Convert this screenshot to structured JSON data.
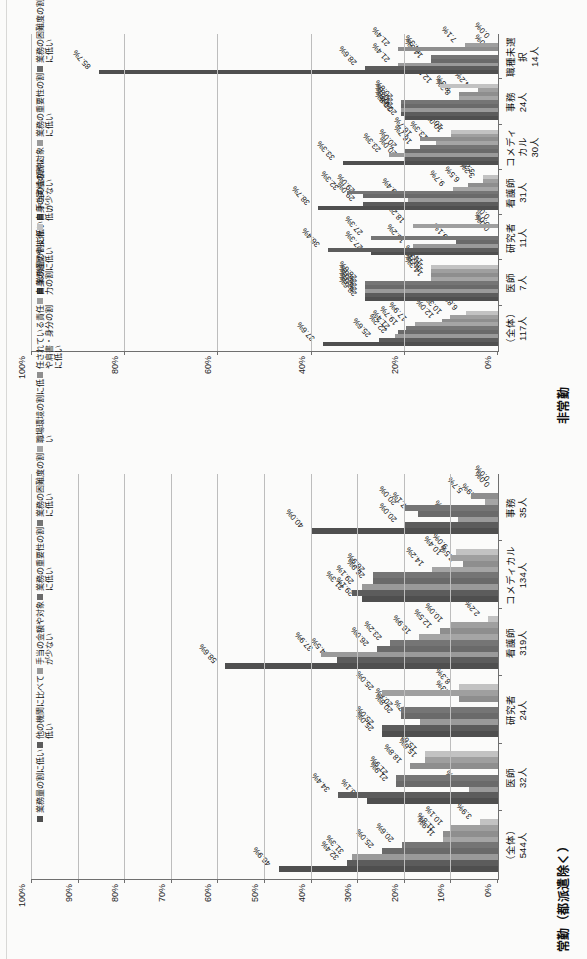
{
  "page": {
    "background": "#fbfbfa"
  },
  "charts": [
    {
      "id": "hijoukin",
      "title": "非常勤",
      "legend_position": "top-center",
      "chart_data": {
        "type": "bar",
        "title": "非常勤",
        "xlabel": "",
        "ylabel": "",
        "ylim": [
          0,
          100
        ],
        "yticks": [
          "0%",
          "20%",
          "40%",
          "60%",
          "80%",
          "100%"
        ],
        "grid": true,
        "categories": [
          "（全体）\n117人",
          "医師\n7人",
          "研究者\n11人",
          "看護師\n31人",
          "コメディカル\n30人",
          "事務\n24人",
          "職種未選択\n14人"
        ],
        "series": [
          {
            "name": "業務量の割に低い",
            "color": "#4f4f4f",
            "values": [
              37.6,
              28.6,
              27.3,
              38.7,
              33.3,
              20.0,
              85.7
            ],
            "labels": [
              "37.6%",
              "28.6%",
              "27.3%",
              "38.7%",
              "33.3%",
              "20.0%",
              "85.7%"
            ]
          },
          {
            "name": "手当の金額や対象が少ない",
            "color": "#5c5c5c",
            "values": [
              25.6,
              28.6,
              36.4,
              29.0,
              20.0,
              20.8,
              28.6
            ],
            "labels": [
              "25.6%",
              "28.6%",
              "36.4%",
              "29.0%",
              "20.0%",
              "20.8%",
              "28.6%"
            ]
          },
          {
            "name": "業務の重要性の割に低い",
            "color": "#9a9a9a",
            "values": [
              22.2,
              28.6,
              18.2,
              19.4,
              23.3,
              20.8,
              21.4
            ],
            "labels": [
              "22.2%",
              "28.6%",
              "18.2%",
              "19.4%",
              "23.3%",
              "20.8%",
              "21.4%"
            ]
          },
          {
            "name": "業務の困難度の割に低い",
            "color": "#6a6a6a",
            "values": [
              21.4,
              28.6,
              9.1,
              29.0,
              20.0,
              20.8,
              14.3
            ],
            "labels": [
              "21.4%",
              "28.6%",
              "9.1%",
              "29.0%",
              "20.0%",
              "20.8%",
              "14.3%"
            ]
          },
          {
            "name": "他の機関に比べて低い",
            "color": "#757575",
            "values": [
              19.7,
              28.6,
              27.3,
              32.3,
              16.7,
              20.8,
              14.3
            ],
            "labels": [
              "19.7%",
              "28.6%",
              "27.3%",
              "32.3%",
              "16.7%",
              "20.8%",
              "14.3%"
            ]
          },
          {
            "name": "自身の経歴や技術力の割に低い",
            "color": "#a5a5a5",
            "values": [
              17.9,
              14.3,
              0.0,
              9.7,
              13.3,
              8.3,
              0.0
            ],
            "labels": [
              "17.9%",
              "14.3%",
              "0.0%",
              "9.7%",
              "13.3%",
              "8.3%",
              "0.0%"
            ]
          },
          {
            "name": "職場環境の割に低い",
            "color": "#8e8e8e",
            "values": [
              12.0,
              14.3,
              0.0,
              6.5,
              16.7,
              8.3,
              21.4
            ],
            "labels": [
              "12.0%",
              "14.3%",
              "0.0%",
              "6.5%",
              "16.7%",
              "8.3%",
              "21.4%"
            ]
          },
          {
            "name": "自身の実績の割に低い",
            "color": "#9f9f9f",
            "values": [
              10.3,
              14.3,
              18.2,
              3.2,
              10.0,
              4.2,
              7.1
            ],
            "labels": [
              "10.3%",
              "14.3%",
              "18.2%",
              "3.2%",
              "10.0%",
              "4.2%",
              "7.1%"
            ]
          },
          {
            "name": "任されている責任や肩書・身分の割に低い",
            "color": "#c2c2c2",
            "values": [
              6.8,
              14.3,
              0.0,
              3.2,
              10.0,
              12.5,
              0.0
            ],
            "labels": [
              "6.8%",
              "14.3%",
              "0.0%",
              "3.2%",
              "10.0%",
              "12.5%",
              "0.0%"
            ]
          }
        ]
      }
    },
    {
      "id": "joukin",
      "title": "常勤（都派遣除く）",
      "legend_position": "top-center",
      "chart_data": {
        "type": "bar",
        "title": "常勤（都派遣除く）",
        "xlabel": "",
        "ylabel": "",
        "ylim": [
          0,
          100
        ],
        "yticks": [
          "0%",
          "10%",
          "20%",
          "30%",
          "40%",
          "50%",
          "60%",
          "70%",
          "80%",
          "90%",
          "100%"
        ],
        "grid": true,
        "categories": [
          "（全体）\n544人",
          "医師\n32人",
          "研究者\n24人",
          "看護師\n319人",
          "コメディカル\n134人",
          "事務\n35人"
        ],
        "series": [
          {
            "name": "業務量の割に低い",
            "color": "#4f4f4f",
            "values": [
              46.9,
              28.1,
              25.0,
              58.6,
              29.1,
              40.0
            ],
            "labels": [
              "46.9%",
              "28.1%",
              "25.0%",
              "58.6%",
              "29.1%",
              "40.0%"
            ]
          },
          {
            "name": "他の機関に比べて低い",
            "color": "#5c5c5c",
            "values": [
              32.4,
              34.4,
              25.0,
              34.5,
              31.3,
              20.0
            ],
            "labels": [
              "32.4%",
              "34.4%",
              "25.0%",
              "34.5%",
              "31.3%",
              "20.0%"
            ]
          },
          {
            "name": "手当の金額や対象が少ない",
            "color": "#9a9a9a",
            "values": [
              31.3,
              6.3,
              16.7,
              37.9,
              29.1,
              8.6
            ],
            "labels": [
              "31.3%",
              "6.3%",
              "16.7%",
              "37.9%",
              "29.1%",
              "8.6%"
            ]
          },
          {
            "name": "業務の重要性の割に低い",
            "color": "#6a6a6a",
            "values": [
              25.0,
              21.9,
              20.8,
              26.0,
              26.9,
              17.1
            ],
            "labels": [
              "25.0%",
              "21.9%",
              "20.8%",
              "26.0%",
              "26.9%",
              "17.1%"
            ]
          },
          {
            "name": "業務の困難度の割に低い",
            "color": "#757575",
            "values": [
              20.6,
              21.9,
              20.8,
              23.2,
              26.9,
              20.0
            ],
            "labels": [
              "20.6%",
              "21.9%",
              "20.8%",
              "23.2%",
              "26.9%",
              "20.0%"
            ]
          },
          {
            "name": "職場環境の割に低い",
            "color": "#a5a5a5",
            "values": [
              11.9,
              0.0,
              0.0,
              16.9,
              14.2,
              2.9
            ],
            "labels": [
              "11.9%",
              "0.0%",
              "0.0%",
              "16.9%",
              "14.2%",
              "2.9%"
            ]
          },
          {
            "name": "任されている責任や肩書・身分の割に低い",
            "color": "#8e8e8e",
            "values": [
              11.8,
              18.8,
              8.3,
              12.5,
              7.5,
              5.7
            ],
            "labels": [
              "11.8%",
              "18.8%",
              "8.3%",
              "12.5%",
              "7.5%",
              "5.7%"
            ]
          },
          {
            "name": "自身の経歴や技術力の割に低い",
            "color": "#9f9f9f",
            "values": [
              10.1,
              15.6,
              25.0,
              10.0,
              10.4,
              0.0
            ],
            "labels": [
              "10.1%",
              "15.6%",
              "25.0%",
              "10.0%",
              "10.4%",
              "0.0%"
            ]
          },
          {
            "name": "自身の実績の割に低い",
            "color": "#c2c2c2",
            "values": [
              3.9,
              15.6,
              8.3,
              2.2,
              9.0,
              0.0
            ],
            "labels": [
              "3.9%",
              "15.6%",
              "8.3%",
              "2.2%",
              "9.0%",
              "0.0%"
            ]
          }
        ]
      }
    }
  ]
}
